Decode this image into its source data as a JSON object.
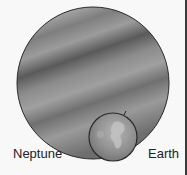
{
  "diagram": {
    "bodies": [
      {
        "name": "Neptune",
        "label": "Neptune",
        "color": "#7a7a7a",
        "cx": 93,
        "cy": 83,
        "r": 76
      },
      {
        "name": "Earth",
        "label": "Earth",
        "color": "#8a8a8a",
        "cx": 113,
        "cy": 137,
        "r": 24
      }
    ]
  },
  "labels": {
    "neptune": "Neptune",
    "earth": "Earth"
  },
  "colors": {
    "background": "#f8f8f8",
    "neptune": "#7a7a7a",
    "earth": "#8a8a8a",
    "outline": "#2a2a2a",
    "border": "#3a3a3a"
  }
}
